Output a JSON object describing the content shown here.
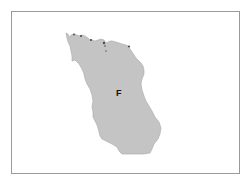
{
  "map": {
    "regions": [
      {
        "label": "F",
        "fill": "#c4c4c4",
        "outline": "#9e9e9e"
      }
    ],
    "colors": {
      "frame_border": "#9a9a9a",
      "background": "#ffffff",
      "coast_dots": "#4a4a4a"
    }
  }
}
